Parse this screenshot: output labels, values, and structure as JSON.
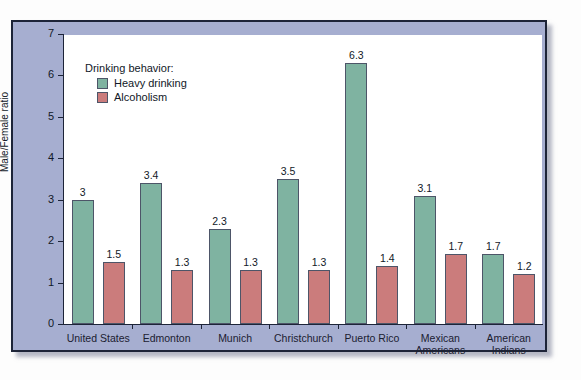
{
  "chart_data": {
    "type": "bar",
    "title": "",
    "xlabel": "",
    "ylabel": "Male/Female ratio",
    "ylim": [
      0,
      7
    ],
    "yticks": [
      0,
      1,
      2,
      3,
      4,
      5,
      6,
      7
    ],
    "grid": false,
    "legend_position": "top-left",
    "legend_title": "Drinking behavior:",
    "categories": [
      "United States",
      "Edmonton",
      "Munich",
      "Christchurch",
      "Puerto Rico",
      "Mexican Americans",
      "American Indians"
    ],
    "series": [
      {
        "name": "Heavy drinking",
        "color": "#7fb3a1",
        "values": [
          3,
          3.4,
          2.3,
          3.5,
          6.3,
          3.1,
          1.7
        ],
        "labels": [
          "3",
          "3.4",
          "2.3",
          "3.5",
          "6.3",
          "3.1",
          "1.7"
        ]
      },
      {
        "name": "Alcoholism",
        "color": "#cb7c7c",
        "values": [
          1.5,
          1.3,
          1.3,
          1.3,
          1.4,
          1.7,
          1.2
        ],
        "labels": [
          "1.5",
          "1.3",
          "1.3",
          "1.3",
          "1.4",
          "1.7",
          "1.2"
        ]
      }
    ]
  },
  "figure": {
    "panel_color": "#a6aed0",
    "plot_background": "#ffffff",
    "border_color": "#1d2438"
  }
}
